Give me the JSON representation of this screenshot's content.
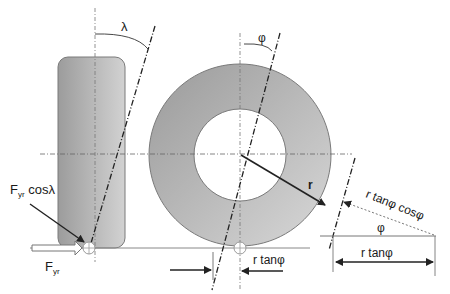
{
  "diagram": {
    "labels": {
      "lambda": "λ",
      "phi_top": "φ",
      "radius": "r",
      "force_component": {
        "main": "F",
        "sub": "yr",
        "suffix": " cosλ"
      },
      "force": {
        "main": "F",
        "sub": "yr"
      },
      "r_tanphi_bottom": "r tanφ",
      "r_tanphi_cosphi": "r tanφ cosφ",
      "phi_detail": "φ",
      "r_tanphi_detail": "r tanφ"
    },
    "colors": {
      "tire_fill_dark": "#9a9a9a",
      "tire_fill_light": "#d4d4d4",
      "outline": "#7a7a7a",
      "line": "#222222",
      "background": "#ffffff"
    }
  }
}
